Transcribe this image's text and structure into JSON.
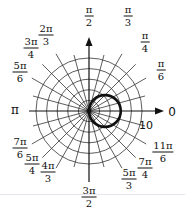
{
  "chart_data": {
    "type": "polar",
    "title": "",
    "grid": {
      "rings": [
        2,
        4,
        6,
        8,
        10
      ],
      "ring_label": "10",
      "spokes_deg_step": 15
    },
    "angle_labels": [
      {
        "num": "π",
        "den": "2",
        "angle_deg": 90
      },
      {
        "num": "π",
        "den": "3",
        "angle_deg": 60
      },
      {
        "num": "π",
        "den": "4",
        "angle_deg": 45
      },
      {
        "num": "π",
        "den": "6",
        "angle_deg": 30
      },
      {
        "num": "2π",
        "den": "3",
        "angle_deg": 120
      },
      {
        "num": "3π",
        "den": "4",
        "angle_deg": 135
      },
      {
        "num": "5π",
        "den": "6",
        "angle_deg": 150
      },
      {
        "num": "7π",
        "den": "6",
        "angle_deg": 210
      },
      {
        "num": "5π",
        "den": "4",
        "angle_deg": 225
      },
      {
        "num": "4π",
        "den": "3",
        "angle_deg": 240
      },
      {
        "num": "3π",
        "den": "2",
        "angle_deg": 270
      },
      {
        "num": "5π",
        "den": "3",
        "angle_deg": 300
      },
      {
        "num": "7π",
        "den": "4",
        "angle_deg": 315
      },
      {
        "num": "11π",
        "den": "6",
        "angle_deg": 330
      }
    ],
    "axis_labels": {
      "zero": "0",
      "pi": "π"
    },
    "series": [
      {
        "name": "r = 6cosθ",
        "equation": "r = 6cos(theta)",
        "shape": "circle",
        "center_polar": [
          3,
          0
        ],
        "radius": 3
      }
    ],
    "rlim": [
      0,
      10
    ]
  }
}
